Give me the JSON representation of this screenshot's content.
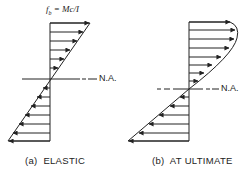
{
  "figure": {
    "panels": [
      {
        "id": "a",
        "caption": "(a)  ELASTIC",
        "formula_label": "f_b = Mc/I",
        "formula_display": "f",
        "formula_sub": "b",
        "formula_rest": " = Mc/I",
        "neutral_axis_label": "N.A.",
        "distribution": "linear"
      },
      {
        "id": "b",
        "caption": "(b)  AT ULTIMATE",
        "neutral_axis_label": "N.A.",
        "distribution": "curved compression, linear tension"
      }
    ],
    "colors": {
      "line": "#222222",
      "background": "#ffffff"
    }
  }
}
